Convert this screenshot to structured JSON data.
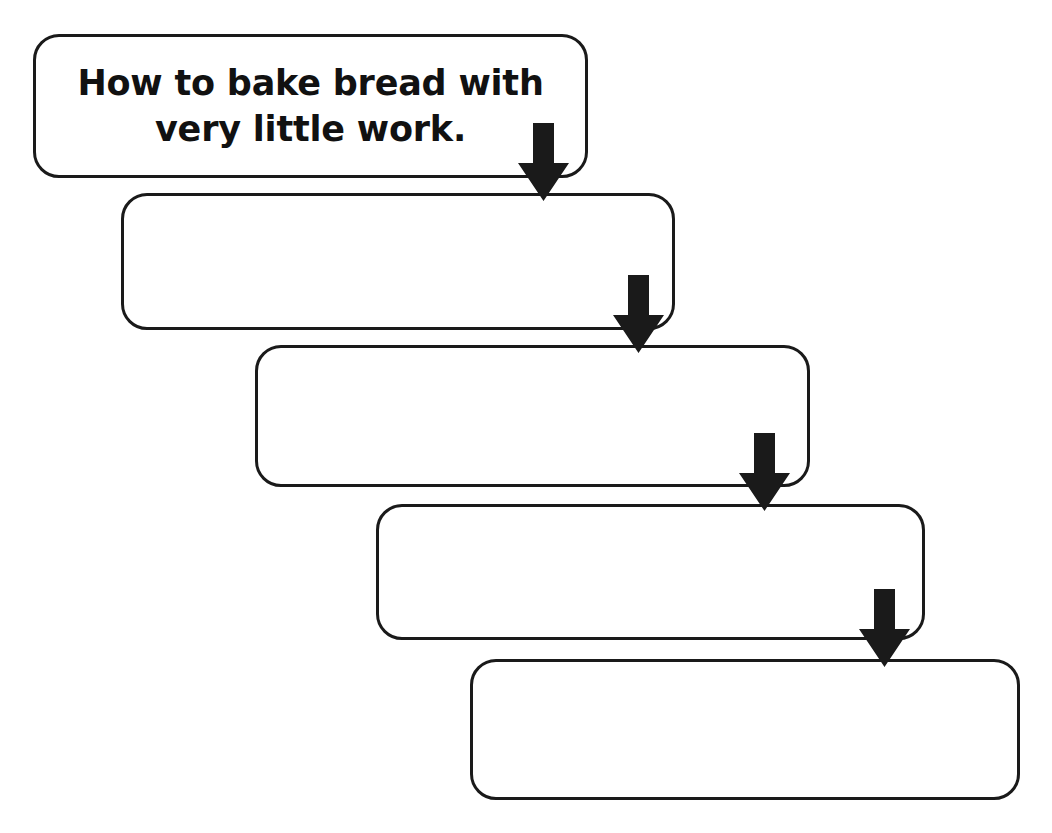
{
  "diagram": {
    "title": "How to bake bread with very little work.",
    "type": "vertical-cascading-flowchart",
    "background_color": "#ffffff",
    "stroke_color": "#1a1a1a",
    "arrow_color": "#1a1a1a",
    "step_count": 5,
    "arrow_count": 4,
    "steps": [
      {
        "id": "step-1",
        "label": "How to bake bread with\nvery little work.",
        "has_text": true,
        "x": 33,
        "y": 34,
        "width": 555,
        "height": 144
      },
      {
        "id": "step-2",
        "label": "",
        "has_text": false,
        "x": 121,
        "y": 193,
        "width": 554,
        "height": 137
      },
      {
        "id": "step-3",
        "label": "",
        "has_text": false,
        "x": 255,
        "y": 345,
        "width": 555,
        "height": 142
      },
      {
        "id": "step-4",
        "label": "",
        "has_text": false,
        "x": 376,
        "y": 504,
        "width": 549,
        "height": 136
      },
      {
        "id": "step-5",
        "label": "",
        "has_text": false,
        "x": 470,
        "y": 659,
        "width": 550,
        "height": 141
      }
    ],
    "arrows": [
      {
        "id": "arrow-1-2",
        "from": "step-1",
        "to": "step-2",
        "x": 518,
        "y": 123,
        "width": 51,
        "height": 78
      },
      {
        "id": "arrow-2-3",
        "from": "step-2",
        "to": "step-3",
        "x": 613,
        "y": 275,
        "width": 51,
        "height": 78
      },
      {
        "id": "arrow-3-4",
        "from": "step-3",
        "to": "step-4",
        "x": 739,
        "y": 433,
        "width": 51,
        "height": 78
      },
      {
        "id": "arrow-4-5",
        "from": "step-4",
        "to": "step-5",
        "x": 859,
        "y": 589,
        "width": 51,
        "height": 78
      }
    ]
  }
}
